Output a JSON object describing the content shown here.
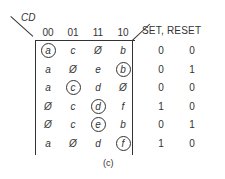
{
  "diagram": {
    "corner_label": "CD",
    "columns": [
      "00",
      "01",
      "11",
      "10"
    ],
    "output_header": "SET, RESET",
    "rows": [
      {
        "cells": [
          {
            "v": "a",
            "c": true
          },
          {
            "v": "c",
            "c": false
          },
          {
            "v": "Ø",
            "c": false
          },
          {
            "v": "b",
            "c": false
          }
        ],
        "set": "0",
        "reset": "0"
      },
      {
        "cells": [
          {
            "v": "a",
            "c": false
          },
          {
            "v": "Ø",
            "c": false
          },
          {
            "v": "e",
            "c": false
          },
          {
            "v": "b",
            "c": true
          }
        ],
        "set": "0",
        "reset": "1"
      },
      {
        "cells": [
          {
            "v": "a",
            "c": false
          },
          {
            "v": "c",
            "c": true
          },
          {
            "v": "d",
            "c": false
          },
          {
            "v": "Ø",
            "c": false
          }
        ],
        "set": "0",
        "reset": "0"
      },
      {
        "cells": [
          {
            "v": "Ø",
            "c": false
          },
          {
            "v": "c",
            "c": false
          },
          {
            "v": "d",
            "c": true
          },
          {
            "v": "f",
            "c": false
          }
        ],
        "set": "1",
        "reset": "0"
      },
      {
        "cells": [
          {
            "v": "Ø",
            "c": false
          },
          {
            "v": "c",
            "c": false
          },
          {
            "v": "e",
            "c": true
          },
          {
            "v": "b",
            "c": false
          }
        ],
        "set": "0",
        "reset": "1"
      },
      {
        "cells": [
          {
            "v": "a",
            "c": false
          },
          {
            "v": "Ø",
            "c": false
          },
          {
            "v": "d",
            "c": false
          },
          {
            "v": "f",
            "c": true
          }
        ],
        "set": "1",
        "reset": "0"
      }
    ],
    "caption": "(c)"
  }
}
